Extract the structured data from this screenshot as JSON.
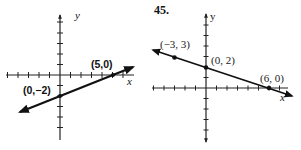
{
  "graphs": [
    {
      "problem_number": ".",
      "axis_labels": {
        "x": "x",
        "y": "y"
      },
      "points": [
        {
          "label": "(5,0)",
          "x": 5,
          "y": 0
        },
        {
          "label": "(0,−2)",
          "x": 0,
          "y": -2
        }
      ],
      "line": {
        "through": [
          [
            0,
            -2
          ],
          [
            5,
            0
          ]
        ],
        "slope": 0.4,
        "intercept": -2
      },
      "ticks": {
        "x_range": [
          -5,
          6
        ],
        "y_range": [
          -5,
          5
        ]
      }
    },
    {
      "problem_number": "45.",
      "axis_labels": {
        "x": "x",
        "y": "y"
      },
      "points": [
        {
          "label": "(−3, 3)",
          "x": -3,
          "y": 3
        },
        {
          "label": "(0, 2)",
          "x": 0,
          "y": 2
        },
        {
          "label": "(6, 0)",
          "x": 6,
          "y": 0
        }
      ],
      "line": {
        "through": [
          [
            -3,
            3
          ],
          [
            0,
            2
          ],
          [
            6,
            0
          ]
        ],
        "slope": -0.3333,
        "intercept": 2
      },
      "ticks": {
        "x_range": [
          -5,
          7
        ],
        "y_range": [
          -4,
          4
        ]
      }
    }
  ]
}
